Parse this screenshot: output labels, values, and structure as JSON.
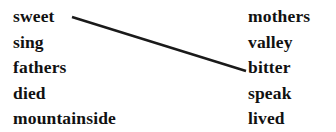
{
  "exercise": {
    "background_color": "#ffffff",
    "text_color": "#111111",
    "line_color": "#1a1a1a",
    "left_column": {
      "items": [
        {
          "label": "sweet"
        },
        {
          "label": "sing"
        },
        {
          "label": "fathers"
        },
        {
          "label": "died"
        },
        {
          "label": "mountainside"
        }
      ]
    },
    "right_column": {
      "items": [
        {
          "label": "mothers"
        },
        {
          "label": "valley"
        },
        {
          "label": "bitter"
        },
        {
          "label": "speak"
        },
        {
          "label": "lived"
        }
      ]
    },
    "connections": [
      {
        "from": "sweet",
        "to": "bitter",
        "x1": 72,
        "y1": 17,
        "x2": 246,
        "y2": 71,
        "stroke_width": 2.4
      }
    ]
  }
}
